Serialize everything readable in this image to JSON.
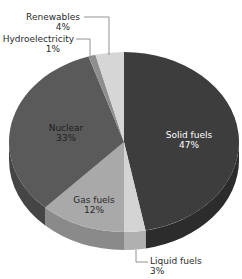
{
  "chart_data": {
    "type": "pie",
    "style": "3d-tilted",
    "title": "",
    "start_angle_deg": 0,
    "direction": "clockwise",
    "slices": [
      {
        "label": "Solid fuels",
        "value": 47,
        "display": "47%",
        "color": "#3d3d3d",
        "side_color": "#2c2c2c"
      },
      {
        "label": "Liquid fuels",
        "value": 3,
        "display": "3%",
        "color": "#d4d4d4",
        "side_color": "#b0b0b0"
      },
      {
        "label": "Gas fuels",
        "value": 12,
        "display": "12%",
        "color": "#a9a9a9",
        "side_color": "#8a8a8a"
      },
      {
        "label": "Nuclear",
        "value": 33,
        "display": "33%",
        "color": "#5a5a5a",
        "side_color": "#454545"
      },
      {
        "label": "Hydroelectricity",
        "value": 1,
        "display": "1%",
        "color": "#8e8e8e",
        "side_color": "#707070"
      },
      {
        "label": "Renewables",
        "value": 4,
        "display": "4%",
        "color": "#d6d6d6",
        "side_color": "#b4b4b4"
      }
    ],
    "legend": "none (labels placed on/beside slices)"
  },
  "labels": {
    "solid_name": "Solid fuels",
    "solid_pct": "47%",
    "liquid_name": "Liquid fuels",
    "liquid_pct": "3%",
    "gas_name": "Gas fuels",
    "gas_pct": "12%",
    "nuclear_name": "Nuclear",
    "nuclear_pct": "33%",
    "hydro_name": "Hydroelectricity",
    "hydro_pct": "1%",
    "renew_name": "Renewables",
    "renew_pct": "4%"
  }
}
